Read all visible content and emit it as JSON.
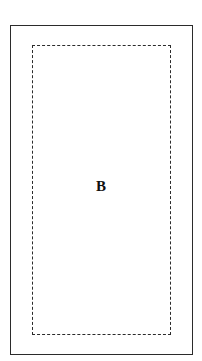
{
  "diagram": {
    "background_color": "#ffffff",
    "line_color": "#2b2b2b",
    "label_color": "#101010",
    "outer_region": {
      "name": "outer-solid-rectangle",
      "border_style": "solid",
      "label": ""
    },
    "inner_region": {
      "name": "inner-dashed-rectangle",
      "border_style": "dashed",
      "label": "B"
    }
  }
}
